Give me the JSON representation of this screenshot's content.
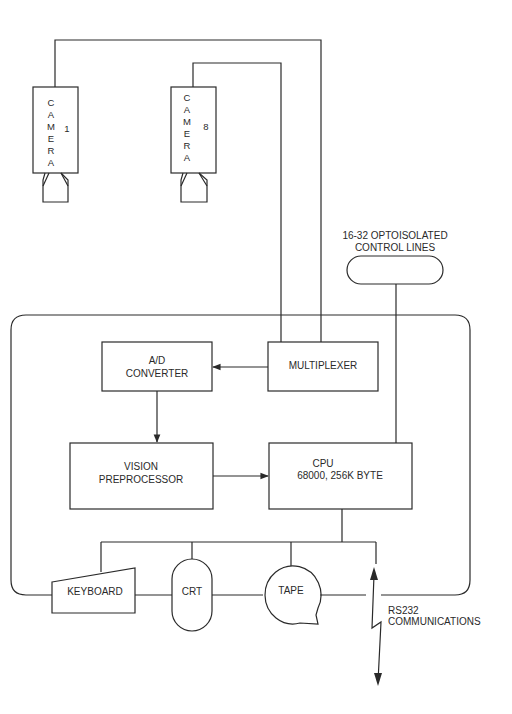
{
  "diagram": {
    "type": "block-diagram",
    "cameras": [
      {
        "letters": [
          "C",
          "A",
          "M",
          "E",
          "R",
          "A"
        ],
        "number": "1"
      },
      {
        "letters": [
          "C",
          "A",
          "M",
          "E",
          "R",
          "A"
        ],
        "number": "8"
      }
    ],
    "control_lines": {
      "line1": "16-32 OPTOISOLATED",
      "line2": "CONTROL LINES"
    },
    "blocks": {
      "multiplexer": "MULTIPLEXER",
      "ad_converter": {
        "line1": "A/D",
        "line2": "CONVERTER"
      },
      "vision_preprocessor": {
        "line1": "VISION",
        "line2": "PREPROCESSOR"
      },
      "cpu": {
        "line1": "CPU",
        "line2": "68000, 256K BYTE"
      }
    },
    "peripherals": {
      "keyboard": "KEYBOARD",
      "crt": "CRT",
      "tape": "TAPE"
    },
    "rs232": {
      "line1": "RS232",
      "line2": "COMMUNICATIONS"
    },
    "colors": {
      "stroke": "#2a2a2a",
      "background": "#ffffff"
    }
  }
}
